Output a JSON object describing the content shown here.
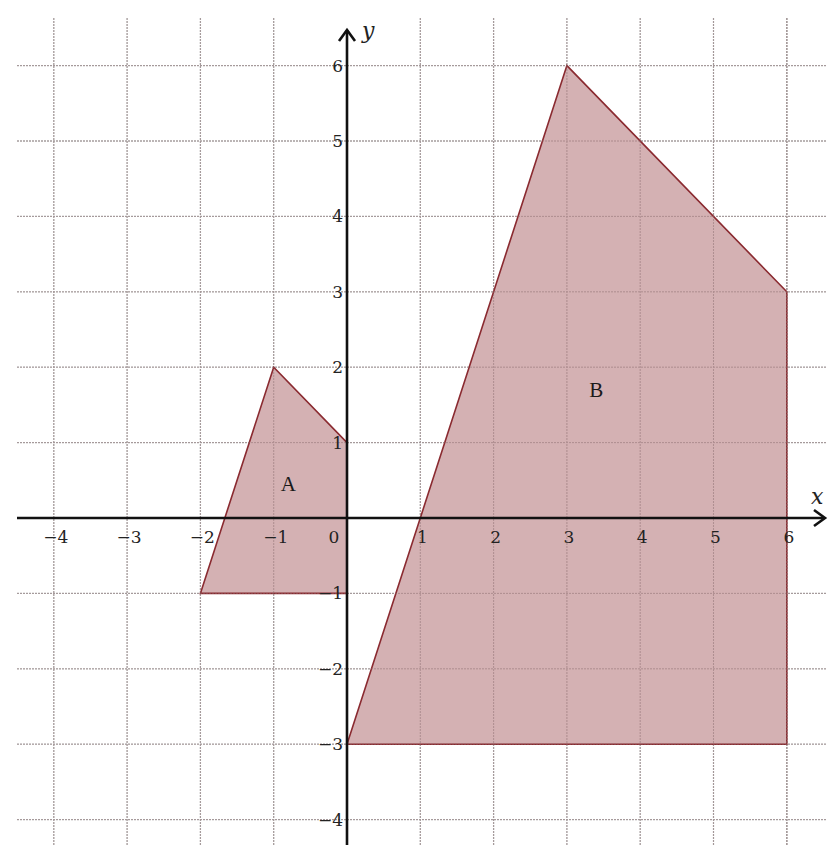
{
  "chart_data": {
    "type": "coordinate-grid",
    "title": "",
    "xlabel": "x",
    "ylabel": "y",
    "xlim": [
      -4,
      6
    ],
    "ylim": [
      -4,
      6
    ],
    "grid": true,
    "x_ticks": [
      -4,
      -3,
      -2,
      -1,
      0,
      1,
      2,
      3,
      4,
      5,
      6
    ],
    "y_ticks": [
      -4,
      -3,
      -2,
      -1,
      1,
      2,
      3,
      4,
      5,
      6
    ],
    "x_tick_labels": [
      "−4",
      "−3",
      "−2",
      "−1",
      "0",
      "1",
      "2",
      "3",
      "4",
      "5",
      "6"
    ],
    "y_tick_labels": [
      "−4",
      "−3",
      "−2",
      "−1",
      "1",
      "2",
      "3",
      "4",
      "5",
      "6"
    ],
    "shapes": [
      {
        "name": "A",
        "vertices": [
          [
            -2,
            -1
          ],
          [
            -1,
            2
          ],
          [
            0,
            1
          ],
          [
            0,
            -1
          ]
        ],
        "label_position": [
          -0.8,
          0.45
        ]
      },
      {
        "name": "B",
        "vertices": [
          [
            0,
            -3
          ],
          [
            3,
            6
          ],
          [
            6,
            3
          ],
          [
            6,
            -3
          ]
        ],
        "label_position": [
          3.4,
          1.7
        ]
      }
    ]
  },
  "style": {
    "fill_color": "#cfa9ab",
    "stroke_color": "#8a2a30",
    "grid_color": "#b9b9b9",
    "axis_color": "#111111"
  },
  "labels": {
    "x_axis": "x",
    "y_axis": "y",
    "shape_a": "A",
    "shape_b": "B"
  }
}
